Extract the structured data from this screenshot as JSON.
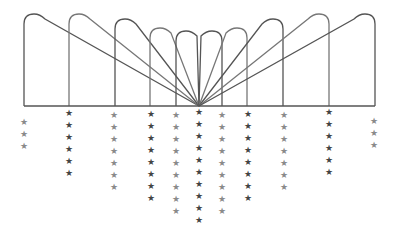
{
  "diagram": {
    "baseline": {
      "y": 106,
      "x1": 24,
      "x2": 375,
      "color": "#555555"
    },
    "focus": {
      "x": 199,
      "y": 106
    },
    "arches": [
      {
        "x": 24,
        "top": 14,
        "side": "left",
        "color": "#555555"
      },
      {
        "x": 69,
        "top": 14,
        "side": "left",
        "color": "#777777"
      },
      {
        "x": 115,
        "top": 19,
        "side": "left",
        "color": "#555555"
      },
      {
        "x": 150,
        "top": 28,
        "side": "left",
        "color": "#777777"
      },
      {
        "x": 176,
        "top": 31,
        "side": "left",
        "color": "#555555"
      },
      {
        "x": 222,
        "top": 31,
        "side": "right",
        "color": "#555555"
      },
      {
        "x": 247,
        "top": 28,
        "side": "right",
        "color": "#777777"
      },
      {
        "x": 283,
        "top": 19,
        "side": "right",
        "color": "#555555"
      },
      {
        "x": 329,
        "top": 14,
        "side": "right",
        "color": "#777777"
      },
      {
        "x": 375,
        "top": 14,
        "side": "right",
        "color": "#555555"
      }
    ],
    "star_columns": [
      {
        "x": 24,
        "count": 3,
        "start_y": 122,
        "color": "#8a8a8a"
      },
      {
        "x": 69,
        "count": 6,
        "start_y": 113,
        "color": "#444444"
      },
      {
        "x": 114,
        "count": 7,
        "start_y": 115,
        "color": "#8a8a8a"
      },
      {
        "x": 151,
        "count": 8,
        "start_y": 114,
        "color": "#444444"
      },
      {
        "x": 176,
        "count": 9,
        "start_y": 115,
        "color": "#8a8a8a"
      },
      {
        "x": 199,
        "count": 10,
        "start_y": 112,
        "color": "#444444"
      },
      {
        "x": 222,
        "count": 9,
        "start_y": 115,
        "color": "#8a8a8a"
      },
      {
        "x": 248,
        "count": 8,
        "start_y": 114,
        "color": "#444444"
      },
      {
        "x": 284,
        "count": 7,
        "start_y": 115,
        "color": "#8a8a8a"
      },
      {
        "x": 329,
        "count": 6,
        "start_y": 112,
        "color": "#444444"
      },
      {
        "x": 374,
        "count": 3,
        "start_y": 121,
        "color": "#8a8a8a"
      }
    ],
    "star_spacing": 12,
    "star_glyph": "★"
  }
}
